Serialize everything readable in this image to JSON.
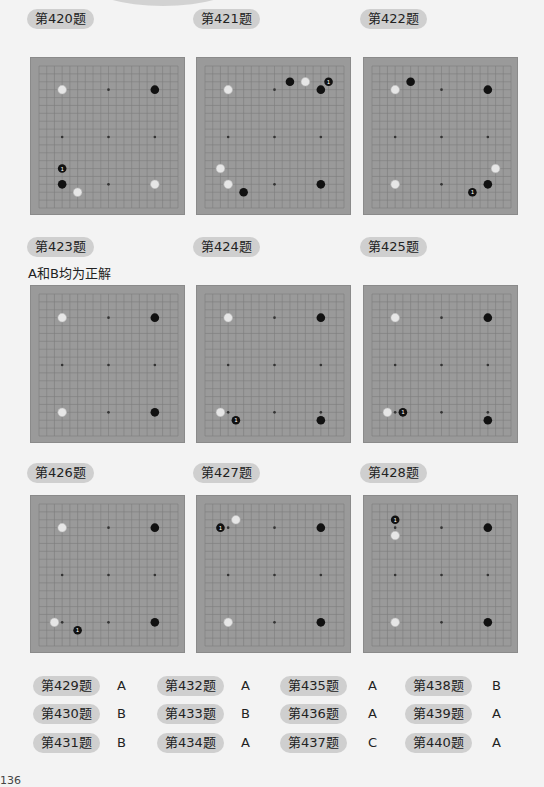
{
  "problems": [
    {
      "label": "第420题",
      "note": "",
      "stones": [
        [
          "w",
          3,
          3
        ],
        [
          "b",
          15,
          3
        ],
        [
          "b1",
          3,
          13
        ],
        [
          "b",
          3,
          15
        ],
        [
          "w",
          5,
          16
        ],
        [
          "w",
          15,
          15
        ]
      ]
    },
    {
      "label": "第421题",
      "note": "",
      "stones": [
        [
          "w",
          3,
          3
        ],
        [
          "b",
          11,
          2
        ],
        [
          "w",
          13,
          2
        ],
        [
          "b1",
          16,
          2
        ],
        [
          "b",
          15,
          3
        ],
        [
          "w",
          2,
          13
        ],
        [
          "w",
          3,
          15
        ],
        [
          "b",
          5,
          16
        ],
        [
          "b",
          15,
          15
        ]
      ]
    },
    {
      "label": "第422题",
      "note": "",
      "stones": [
        [
          "b",
          5,
          2
        ],
        [
          "w",
          3,
          3
        ],
        [
          "b",
          15,
          3
        ],
        [
          "w",
          16,
          13
        ],
        [
          "w",
          3,
          15
        ],
        [
          "b",
          15,
          15
        ],
        [
          "b1",
          13,
          16
        ]
      ]
    },
    {
      "label": "第423题",
      "note": "A和B均为正解",
      "stones": [
        [
          "w",
          3,
          3
        ],
        [
          "b",
          15,
          3
        ],
        [
          "w",
          3,
          15
        ],
        [
          "b",
          15,
          15
        ]
      ]
    },
    {
      "label": "第424题",
      "note": "",
      "stones": [
        [
          "w",
          3,
          3
        ],
        [
          "b",
          15,
          3
        ],
        [
          "w",
          2,
          15
        ],
        [
          "b1",
          4,
          16
        ],
        [
          "b",
          15,
          16
        ]
      ]
    },
    {
      "label": "第425题",
      "note": "",
      "stones": [
        [
          "w",
          3,
          3
        ],
        [
          "b",
          15,
          3
        ],
        [
          "w",
          2,
          15
        ],
        [
          "b1",
          4,
          15
        ],
        [
          "b",
          15,
          16
        ]
      ]
    },
    {
      "label": "第426题",
      "note": "",
      "stones": [
        [
          "w",
          3,
          3
        ],
        [
          "b",
          15,
          3
        ],
        [
          "w",
          2,
          15
        ],
        [
          "b1",
          5,
          16
        ],
        [
          "b",
          15,
          15
        ]
      ]
    },
    {
      "label": "第427题",
      "note": "",
      "stones": [
        [
          "w",
          4,
          2
        ],
        [
          "b1",
          2,
          3
        ],
        [
          "b",
          15,
          3
        ],
        [
          "w",
          3,
          15
        ],
        [
          "b",
          15,
          15
        ]
      ]
    },
    {
      "label": "第428题",
      "note": "",
      "stones": [
        [
          "b1",
          3,
          2
        ],
        [
          "w",
          3,
          4
        ],
        [
          "b",
          15,
          3
        ],
        [
          "w",
          3,
          15
        ],
        [
          "b",
          15,
          15
        ]
      ]
    }
  ],
  "answers": [
    [
      {
        "label": "第429题",
        "value": "A"
      },
      {
        "label": "第432题",
        "value": "A"
      },
      {
        "label": "第435题",
        "value": "A"
      },
      {
        "label": "第438题",
        "value": "B"
      }
    ],
    [
      {
        "label": "第430题",
        "value": "B"
      },
      {
        "label": "第433题",
        "value": "B"
      },
      {
        "label": "第436题",
        "value": "A"
      },
      {
        "label": "第439题",
        "value": "A"
      }
    ],
    [
      {
        "label": "第431题",
        "value": "B"
      },
      {
        "label": "第434题",
        "value": "A"
      },
      {
        "label": "第437题",
        "value": "C"
      },
      {
        "label": "第440题",
        "value": "A"
      }
    ]
  ],
  "page_number": "136",
  "colors": {
    "board": "#9a9a9a",
    "label_bg": "#cfcfcf",
    "black_stone": "#111111",
    "white_stone": "#e6e6e6"
  }
}
